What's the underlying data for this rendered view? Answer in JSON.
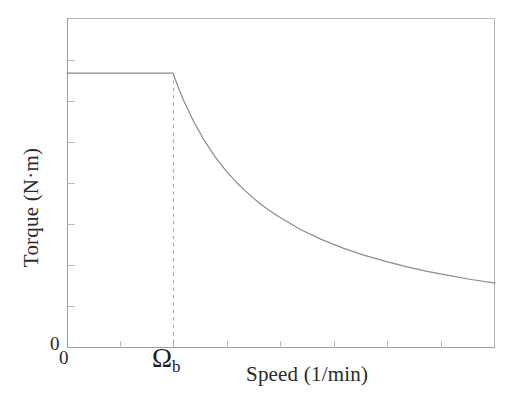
{
  "figure": {
    "width": 521,
    "height": 410,
    "background": "#ffffff"
  },
  "labels": {
    "x_axis_title": "Speed (1/min)",
    "y_axis_title": "Torque (N·m)",
    "origin_y": "0",
    "origin_x": "0",
    "breakpoint_symbol": "Ω",
    "breakpoint_subscript": "b"
  },
  "colors": {
    "curve": "#8d8d8d",
    "frame": "#b3b3b3",
    "dashed": "#a0a0a0",
    "tick": "#b8b8b8",
    "text": "#2b2b2b"
  },
  "chart_data": {
    "type": "line",
    "title": "",
    "subtitle": "",
    "xlabel": "Speed (1/min)",
    "ylabel": "Torque (N·m)",
    "xlim": [
      0,
      4.04
    ],
    "ylim": [
      0,
      1.2
    ],
    "grid": false,
    "legend": null,
    "xticks": [
      0,
      0.5,
      1.0,
      1.5,
      2.0,
      2.5,
      3.0,
      3.5,
      4.0
    ],
    "xticklabels": [
      "0",
      "",
      "Ωb",
      "",
      "",
      "",
      "",
      "",
      ""
    ],
    "yticks": [
      0,
      0.15,
      0.3,
      0.45,
      0.6,
      0.75,
      0.9,
      1.05,
      1.2
    ],
    "yticklabels": [
      "0",
      "",
      "",
      "",
      "",
      "",
      "",
      "",
      ""
    ],
    "annotations": [
      {
        "name": "base-speed-marker",
        "text": "Ωb",
        "x": 1.0,
        "y": 0,
        "style": "dashed vertical line from torque curve down to x-axis"
      }
    ],
    "series": [
      {
        "name": "Torque characteristic",
        "x": [
          0.0,
          0.1,
          0.2,
          0.3,
          0.4,
          0.5,
          0.6,
          0.7,
          0.8,
          0.9,
          1.0,
          1.05,
          1.1,
          1.2,
          1.3,
          1.4,
          1.5,
          1.6,
          1.7,
          1.8,
          1.9,
          2.0,
          2.2,
          2.4,
          2.6,
          2.8,
          3.0,
          3.2,
          3.4,
          3.6,
          3.8,
          4.04
        ],
        "y": [
          1.0,
          1.0,
          1.0,
          1.0,
          1.0,
          1.0,
          1.0,
          1.0,
          1.0,
          1.0,
          1.0,
          0.948,
          0.901,
          0.82,
          0.752,
          0.694,
          0.645,
          0.602,
          0.565,
          0.532,
          0.503,
          0.477,
          0.432,
          0.395,
          0.364,
          0.338,
          0.316,
          0.296,
          0.279,
          0.264,
          0.25,
          0.236
        ]
      }
    ]
  },
  "geometry": {
    "plot_left": 67,
    "plot_right": 495,
    "plot_top": 18,
    "plot_bottom": 348,
    "plateau_y": 73,
    "breakpoint_x": 173
  }
}
